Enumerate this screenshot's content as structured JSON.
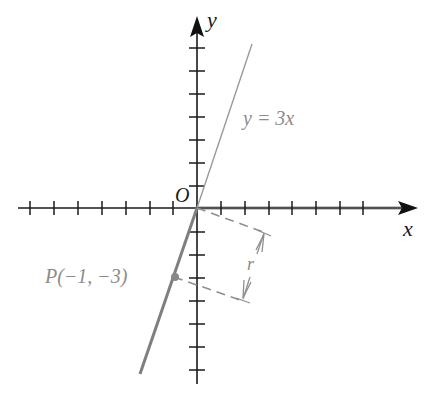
{
  "figure": {
    "axes": {
      "x_label": "x",
      "y_label": "y",
      "origin_label": "O",
      "x_ticks": [
        -7,
        -6,
        -5,
        -4,
        -3,
        -2,
        -1,
        1,
        2,
        3,
        4,
        5,
        6,
        7
      ],
      "y_ticks": [
        -7,
        -6,
        -5,
        -4,
        -3,
        -2,
        -1,
        1,
        2,
        3,
        4,
        5,
        6,
        7
      ]
    },
    "line": {
      "equation_label": "y = 3x",
      "slope": 3
    },
    "point": {
      "label": "P(−1, −3)",
      "x": -1,
      "y": -3
    },
    "distance": {
      "label": "r"
    },
    "colors": {
      "axis": "#1a1a1a",
      "highlight": "#8a8a8a",
      "line": "#9a9a9a",
      "label_gray": "#8c8c8c"
    }
  }
}
